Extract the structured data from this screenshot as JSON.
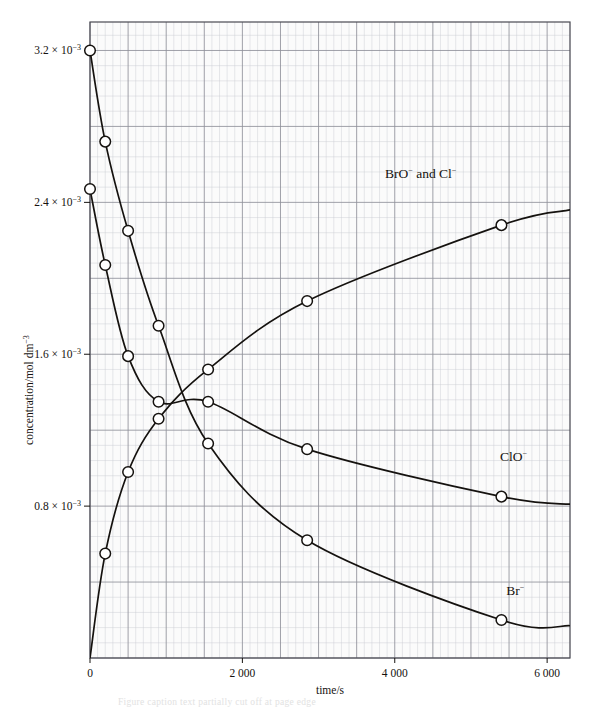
{
  "figure": {
    "background_color": "#ffffff",
    "ink_color": "#15120f",
    "grid_major_color": "#8f9099",
    "grid_minor_color": "#c9cbd2",
    "plot_fill": "#fbfbfb",
    "frame_color": "#4a4a52",
    "marker_fill": "#ffffff",
    "marker_stroke": "#15120f"
  },
  "axes": {
    "x": {
      "label": "time/s",
      "min": 0,
      "max": 6300,
      "ticks": [
        {
          "value": 0,
          "text": "0"
        },
        {
          "value": 2000,
          "text": "2 000"
        },
        {
          "value": 4000,
          "text": "4 000"
        },
        {
          "value": 6000,
          "text": "6 000"
        }
      ]
    },
    "y": {
      "label": "concentration/mol dm",
      "label_exponent": "−3",
      "min": 0,
      "max": 0.00335,
      "ticks": [
        {
          "value": 0.0008,
          "mantissa": "0.8 × 10",
          "exponent": "−3"
        },
        {
          "value": 0.0016,
          "mantissa": "1.6 × 10",
          "exponent": "−3"
        },
        {
          "value": 0.0024,
          "mantissa": "2.4 × 10",
          "exponent": "−3"
        },
        {
          "value": 0.0032,
          "mantissa": "3.2 × 10",
          "exponent": "−3"
        }
      ]
    }
  },
  "chart_data": {
    "type": "line",
    "title": "",
    "xlabel": "time/s",
    "ylabel": "concentration/mol dm−3",
    "xlim": [
      0,
      6300
    ],
    "ylim": [
      0,
      0.00335
    ],
    "grid": true,
    "legend": "inline-end-labels",
    "series": [
      {
        "name": "BrO− and Cl−",
        "label": "BrO",
        "label_sup": "−",
        "label_tail": " and Cl",
        "label_tail_sup": "−",
        "label_x": 4340,
        "label_y": 0.00253,
        "x": [
          0,
          200,
          500,
          900,
          1550,
          2850,
          5400
        ],
        "y": [
          0.0,
          0.00055,
          0.00098,
          0.00126,
          0.00152,
          0.00188,
          0.00228
        ],
        "path_end_x": 6300,
        "path_end_y": 0.00236
      },
      {
        "name": "ClO−",
        "label": "ClO",
        "label_sup": "−",
        "label_tail": "",
        "label_tail_sup": "",
        "label_x": 5560,
        "label_y": 0.00104,
        "x": [
          0,
          200,
          500,
          900,
          1550,
          2850,
          5400
        ],
        "y": [
          0.00247,
          0.00207,
          0.00159,
          0.00135,
          0.00135,
          0.0011,
          0.00085
        ],
        "path_end_x": 6300,
        "path_end_y": 0.00081
      },
      {
        "name": "Br−",
        "label": "Br",
        "label_sup": "−",
        "label_tail": "",
        "label_tail_sup": "",
        "label_x": 5580,
        "label_y": 0.00033,
        "x": [
          0,
          200,
          500,
          900,
          1550,
          2850,
          5400
        ],
        "y": [
          0.0032,
          0.00272,
          0.00225,
          0.00175,
          0.00113,
          0.00062,
          0.0002
        ],
        "path_end_x": 6300,
        "path_end_y": 0.00017
      }
    ]
  },
  "caption": {
    "ghost_text": "Figure caption text partially cut off at page edge"
  }
}
